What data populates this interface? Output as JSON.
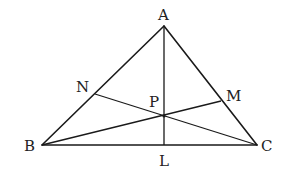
{
  "diagram": {
    "type": "triangle-with-cevians",
    "colors": {
      "stroke": "#1a1a1a",
      "label": "#222222",
      "background": "#ffffff"
    },
    "points": {
      "A": {
        "x": 164,
        "y": 26
      },
      "B": {
        "x": 42,
        "y": 145
      },
      "C": {
        "x": 257,
        "y": 145
      },
      "L": {
        "x": 164,
        "y": 145
      },
      "N": {
        "x": 95,
        "y": 94
      },
      "M": {
        "x": 221,
        "y": 101
      },
      "P": {
        "x": 164,
        "y": 116
      }
    },
    "labels": {
      "A": "A",
      "B": "B",
      "C": "C",
      "L": "L",
      "N": "N",
      "M": "M",
      "P": "P"
    },
    "segments": [
      [
        "A",
        "B"
      ],
      [
        "B",
        "C"
      ],
      [
        "C",
        "A"
      ],
      [
        "A",
        "L"
      ],
      [
        "B",
        "M"
      ],
      [
        "C",
        "N"
      ]
    ]
  }
}
